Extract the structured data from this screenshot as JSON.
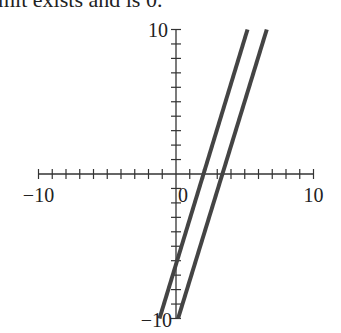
{
  "caption": "mit exists and is 0.",
  "chart_data": {
    "type": "line",
    "title": "",
    "xlabel": "",
    "ylabel": "",
    "xlim": [
      -10,
      10
    ],
    "ylim": [
      -10,
      10
    ],
    "grid": false,
    "x_tick_labels": [
      "−10",
      "10"
    ],
    "y_tick_labels": [
      "10",
      "−10"
    ],
    "origin_label": "0",
    "minor_tick_step": 1,
    "series": [
      {
        "name": "line-1",
        "x": [
          -1.2,
          5.2
        ],
        "y": [
          -10,
          10
        ],
        "color": "#444444"
      },
      {
        "name": "line-2",
        "x": [
          0.15,
          6.6
        ],
        "y": [
          -10,
          10
        ],
        "color": "#444444"
      }
    ]
  },
  "colors": {
    "axis": "#333333",
    "line": "#444444",
    "text": "#222222"
  }
}
